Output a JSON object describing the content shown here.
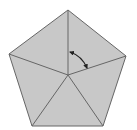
{
  "diagram": {
    "type": "geometry",
    "shape": "regular-pentagon",
    "fill_color": "#c8c8c8",
    "stroke_color": "#666666",
    "arrow_color": "#222222",
    "vertices": [
      [
        68,
        10
      ],
      [
        126,
        56
      ],
      [
        103,
        126
      ],
      [
        32,
        126
      ],
      [
        9,
        54
      ]
    ],
    "center": [
      68,
      75
    ],
    "angle_marker": {
      "type": "double-headed-arc-arrow",
      "between": [
        "center-to-top",
        "center-to-right"
      ],
      "start": [
        70,
        52
      ],
      "end": [
        87,
        68
      ]
    }
  }
}
